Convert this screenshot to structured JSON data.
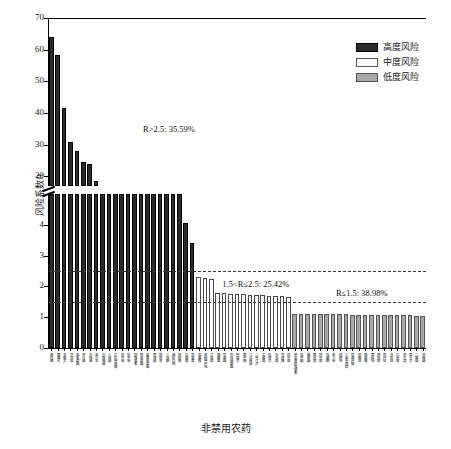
{
  "chart_data": {
    "type": "bar",
    "title": "",
    "xlabel": "非禁用农药",
    "ylabel": "风险系数R",
    "axis_break": true,
    "ylim_lower": [
      0,
      5
    ],
    "ylim_upper": [
      17,
      70
    ],
    "yticks_lower": [
      "0",
      "1",
      "2",
      "3",
      "4"
    ],
    "yticks_upper": [
      "20",
      "30",
      "40",
      "50",
      "60",
      "70"
    ],
    "grid": false,
    "legend_position": "top-right",
    "reference_lines": [
      {
        "value": 2.5,
        "style": "dashed"
      },
      {
        "value": 1.5,
        "style": "dashed"
      }
    ],
    "annotations": [
      {
        "text": "R>2.5: 35.59%",
        "x_frac": 0.32,
        "y_px": 124
      },
      {
        "text": "1.5<R≤2.5: 25.42%",
        "x_frac": 0.55,
        "y_px": 279
      },
      {
        "text": "R≤1.5: 38.98%",
        "x_frac": 0.83,
        "y_px": 288
      }
    ],
    "categories": [
      "毒死蜱",
      "腐霉利",
      "多菌灵",
      "克百威",
      "氯氰菊酯",
      "甲拌磷",
      "辛硫磷",
      "氧乐果",
      "水胺硫磷",
      "三唑磷",
      "乙酰甲胺磷",
      "啶虫脒",
      "吡虫啉",
      "阿维菌素",
      "联苯菊酯",
      "氯氟氰菊酯",
      "丙溴磷",
      "敌敌畏",
      "三唑酮",
      "烯酰吗啉",
      "咪鲜胺",
      "异菌脲",
      "百菌清",
      "嘧霉胺",
      "苯醚甲环唑",
      "戊唑醇",
      "霜霉威",
      "嘧菌酯",
      "吡唑醚菌酯",
      "甲霜灵",
      "氟虫腈",
      "马拉硫磷",
      "二甲戊灵",
      "乙霉威",
      "哒螨灵",
      "灭多威",
      "虫螨腈",
      "茚虫威",
      "甲氨基阿维菌素",
      "噻虫嗪",
      "螺螨酯",
      "氟啶脲",
      "除虫脲",
      "噻嗪酮",
      "苯丁锡",
      "炔螨特",
      "三氯杀螨醇",
      "嘧菌环胺",
      "抑霉唑",
      "咯菌腈",
      "氟硅唑",
      "烯唑醇",
      "丙环唑",
      "多效唑",
      "乙草胺",
      "莠去津",
      "氟乐灵",
      "二嗪磷",
      "倍硫磷"
    ],
    "values": [
      64.0,
      58.2,
      41.5,
      31.0,
      28.0,
      24.6,
      23.8,
      18.5,
      5.0,
      5.0,
      5.0,
      5.0,
      5.0,
      5.0,
      5.0,
      5.0,
      5.0,
      5.0,
      5.0,
      5.0,
      5.0,
      4.05,
      3.42,
      2.3,
      2.28,
      2.25,
      1.78,
      1.77,
      1.76,
      1.75,
      1.74,
      1.73,
      1.72,
      1.71,
      1.7,
      1.69,
      1.68,
      1.67,
      1.12,
      1.11,
      1.11,
      1.1,
      1.1,
      1.1,
      1.09,
      1.09,
      1.09,
      1.08,
      1.08,
      1.08,
      1.08,
      1.07,
      1.07,
      1.07,
      1.06,
      1.06,
      1.06,
      1.05,
      1.05
    ],
    "risk_class": [
      "high",
      "high",
      "high",
      "high",
      "high",
      "high",
      "high",
      "high",
      "high",
      "high",
      "high",
      "high",
      "high",
      "high",
      "high",
      "high",
      "high",
      "high",
      "high",
      "high",
      "high",
      "high",
      "high",
      "mid",
      "mid",
      "mid",
      "mid",
      "mid",
      "mid",
      "mid",
      "mid",
      "mid",
      "mid",
      "mid",
      "mid",
      "mid",
      "mid",
      "mid",
      "low",
      "low",
      "low",
      "low",
      "low",
      "low",
      "low",
      "low",
      "low",
      "low",
      "low",
      "low",
      "low",
      "low",
      "low",
      "low",
      "low",
      "low",
      "low",
      "low",
      "low"
    ],
    "series_groups": [
      {
        "name": "高度风险",
        "count": 23,
        "share": "35.59%"
      },
      {
        "name": "中度风险",
        "count": 15,
        "share": "25.42%"
      },
      {
        "name": "低度风险",
        "count": 21,
        "share": "38.98%"
      }
    ]
  },
  "legend": {
    "items": [
      {
        "label": "高度风险",
        "color": "#2b2b2b",
        "key": "high"
      },
      {
        "label": "中度风险",
        "color": "#fdfdfd",
        "key": "mid"
      },
      {
        "label": "低度风险",
        "color": "#a8a8a8",
        "key": "low"
      }
    ]
  }
}
